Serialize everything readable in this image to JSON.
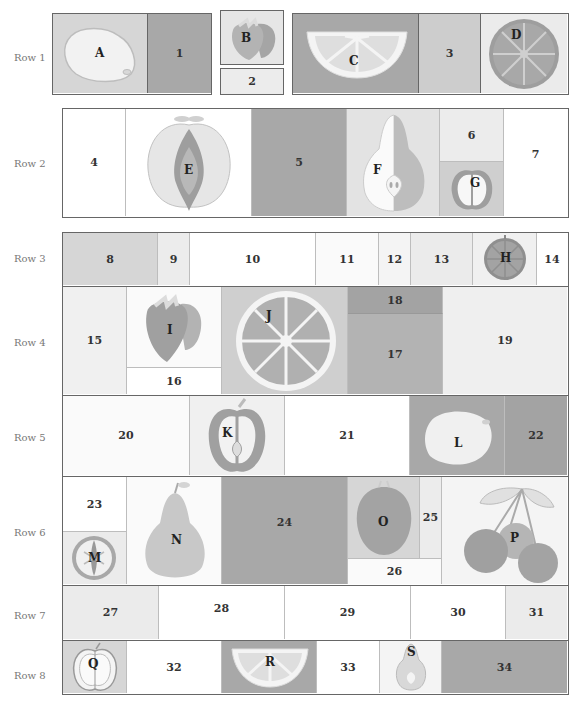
{
  "rows": [
    {
      "label": "Row 1",
      "cells": [
        "A",
        "1",
        "B",
        "2",
        "C",
        "3",
        "D"
      ]
    },
    {
      "label": "Row 2",
      "cells": [
        "4",
        "E",
        "5",
        "F",
        "6",
        "G",
        "7"
      ]
    },
    {
      "label": "Row 3",
      "cells": [
        "8",
        "9",
        "10",
        "11",
        "12",
        "13",
        "H",
        "14"
      ]
    },
    {
      "label": "Row 4",
      "cells": [
        "15",
        "I",
        "16",
        "J",
        "18",
        "17",
        "19"
      ]
    },
    {
      "label": "Row 5",
      "cells": [
        "20",
        "K",
        "21",
        "L",
        "22"
      ]
    },
    {
      "label": "Row 6",
      "cells": [
        "23",
        "M",
        "N",
        "24",
        "O",
        "25",
        "26",
        "P"
      ]
    },
    {
      "label": "Row 7",
      "cells": [
        "27",
        "28",
        "29",
        "30",
        "31"
      ]
    },
    {
      "label": "Row 8",
      "cells": [
        "Q",
        "32",
        "R",
        "33",
        "S",
        "34"
      ]
    }
  ],
  "labels": {
    "A": "A",
    "B": "B",
    "C": "C",
    "D": "D",
    "E": "E",
    "F": "F",
    "G": "G",
    "H": "H",
    "I": "I",
    "J": "J",
    "K": "K",
    "L": "L",
    "M": "M",
    "N": "N",
    "O": "O",
    "P": "P",
    "Q": "Q",
    "R": "R",
    "S": "S",
    "n1": "1",
    "n2": "2",
    "n3": "3",
    "n4": "4",
    "n5": "5",
    "n6": "6",
    "n7": "7",
    "n8": "8",
    "n9": "9",
    "n10": "10",
    "n11": "11",
    "n12": "12",
    "n13": "13",
    "n14": "14",
    "n15": "15",
    "n16": "16",
    "n17": "17",
    "n18": "18",
    "n19": "19",
    "n20": "20",
    "n21": "21",
    "n22": "22",
    "n23": "23",
    "n24": "24",
    "n25": "25",
    "n26": "26",
    "n27": "27",
    "n28": "28",
    "n29": "29",
    "n30": "30",
    "n31": "31",
    "n32": "32",
    "n33": "33",
    "n34": "34"
  },
  "fruits": {
    "A": "lemon",
    "B": "strawberry",
    "C": "citrus-slice",
    "D": "orange-slice",
    "E": "apple-core-cross-section",
    "F": "pear-half",
    "G": "apple-half",
    "H": "kiwi-slice",
    "I": "strawberry",
    "J": "orange-slice",
    "K": "apple-half",
    "L": "lemon",
    "M": "kiwi-cross-section",
    "N": "pear",
    "O": "plum",
    "P": "cherries",
    "Q": "apple-half",
    "R": "citrus-slice",
    "S": "pear-half"
  },
  "colors": {
    "white": "#ffffff",
    "very_light": "#f2f2f2",
    "light": "#e3e3e3",
    "mid_light": "#cfcfcf",
    "mid": "#b8b8b8",
    "dark": "#a3a3a3",
    "border": "#666666"
  }
}
